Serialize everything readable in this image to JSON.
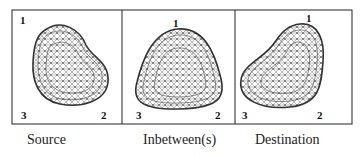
{
  "panels": [
    {
      "id": "source",
      "caption": "Source",
      "labels": {
        "v1": "1",
        "v2": "2",
        "v3": "3"
      }
    },
    {
      "id": "inbetween",
      "caption": "Inbetween(s)",
      "labels": {
        "v1": "1",
        "v2": "2",
        "v3": "3"
      }
    },
    {
      "id": "destination",
      "caption": "Destination",
      "labels": {
        "v1": "1",
        "v2": "2",
        "v3": "3"
      }
    }
  ],
  "colors": {
    "frame": "#222222",
    "mesh": "#555555",
    "outline": "#333333"
  }
}
